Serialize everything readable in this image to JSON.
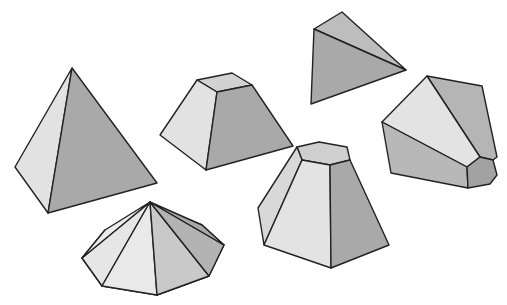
{
  "figure": {
    "colors": {
      "light": "#e3e3e3",
      "mid": "#c8c8c8",
      "dark": "#a9a9a9",
      "stroke": "#222222",
      "background": "#ffffff"
    },
    "shapes": [
      {
        "name": "tetrahedron-pyramid-left"
      },
      {
        "name": "square-frustum"
      },
      {
        "name": "tetrahedron-top"
      },
      {
        "name": "hexagonal-truncated-solid-right"
      },
      {
        "name": "hexagonal-frustum"
      },
      {
        "name": "octagonal-pyramid"
      }
    ]
  }
}
